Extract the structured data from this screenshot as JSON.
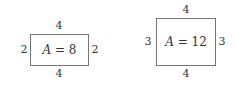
{
  "rectangles": [
    {
      "top_label": "4",
      "bottom_label": "4",
      "left_label": "2",
      "right_label": "2",
      "area_var": "A",
      "area_rest": " = 8"
    },
    {
      "top_label": "4",
      "bottom_label": "4",
      "left_label": "3",
      "right_label": "3",
      "area_var": "A",
      "area_rest": " = 12"
    }
  ]
}
